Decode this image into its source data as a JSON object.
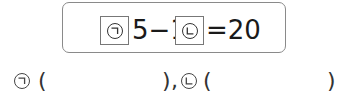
{
  "equation": {
    "blank1_symbol": "㉠",
    "part1": "5−1",
    "blank2_symbol": "㉡",
    "part2": "=20"
  },
  "answers": {
    "item1": {
      "symbol": "㉠",
      "open": "(",
      "close": ")",
      "separator": ",",
      "value": ""
    },
    "item2": {
      "symbol": "㉡",
      "open": "(",
      "close": ")",
      "value": ""
    }
  },
  "colors": {
    "text": "#1a1a1a",
    "border": "#8a8a8a"
  }
}
